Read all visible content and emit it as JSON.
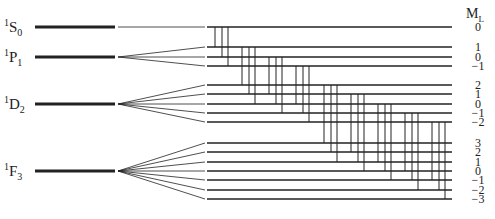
{
  "axis_header": {
    "symbol": "M",
    "subscript": "L"
  },
  "colors": {
    "line": "#222222",
    "background": "#ffffff"
  },
  "terms": [
    {
      "name": "1S0",
      "multiplicity": "1",
      "letter": "S",
      "J": "0",
      "L": 0,
      "ml_values": [
        "0"
      ]
    },
    {
      "name": "1P1",
      "multiplicity": "1",
      "letter": "P",
      "J": "1",
      "L": 1,
      "ml_values": [
        "1",
        "0",
        "−1"
      ]
    },
    {
      "name": "1D2",
      "multiplicity": "1",
      "letter": "D",
      "J": "2",
      "L": 2,
      "ml_values": [
        "2",
        "1",
        "0",
        "−1",
        "−2"
      ]
    },
    {
      "name": "1F3",
      "multiplicity": "1",
      "letter": "F",
      "J": "3",
      "L": 3,
      "ml_values": [
        "3",
        "2",
        "1",
        "0",
        "−1",
        "−2",
        "−3"
      ]
    }
  ],
  "transitions": {
    "rule": "delta M_L = 0, +1, -1 between adjacent terms",
    "groups": [
      "S-P",
      "P-D",
      "D-F"
    ]
  }
}
